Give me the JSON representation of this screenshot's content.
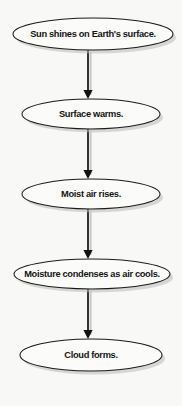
{
  "diagram": {
    "type": "flowchart",
    "orientation": "vertical",
    "background_color": "#f8f8f6",
    "node_shape": "ellipse",
    "node_fill": "#fbfbfa",
    "node_stroke": "#1a1a1a",
    "connector_color": "#111111",
    "shadow_color": "#b9b9b9",
    "nodes": [
      {
        "id": "node-1",
        "label": "Sun shines on Earth's surface.",
        "cx": 93,
        "cy": 34,
        "rx": 80,
        "ry": 16
      },
      {
        "id": "node-2",
        "label": "Surface warms.",
        "cx": 91,
        "cy": 114,
        "rx": 69,
        "ry": 15
      },
      {
        "id": "node-3",
        "label": "Moist air rises.",
        "cx": 91,
        "cy": 194,
        "rx": 69,
        "ry": 15
      },
      {
        "id": "node-4",
        "label": "Moisture condenses as air cools.",
        "cx": 92,
        "cy": 274,
        "rx": 78,
        "ry": 15
      },
      {
        "id": "node-5",
        "label": "Cloud forms.",
        "cx": 91,
        "cy": 355,
        "rx": 71,
        "ry": 16
      }
    ],
    "connectors": [
      {
        "id": "connector-1",
        "from": "node-1",
        "to": "node-2",
        "x": 88,
        "y_start": 50,
        "y_end": 99
      },
      {
        "id": "connector-2",
        "from": "node-2",
        "to": "node-3",
        "x": 88,
        "y_start": 129,
        "y_end": 179
      },
      {
        "id": "connector-3",
        "from": "node-3",
        "to": "node-4",
        "x": 88,
        "y_start": 209,
        "y_end": 259
      },
      {
        "id": "connector-4",
        "from": "node-4",
        "to": "node-5",
        "x": 88,
        "y_start": 289,
        "y_end": 339
      }
    ]
  }
}
